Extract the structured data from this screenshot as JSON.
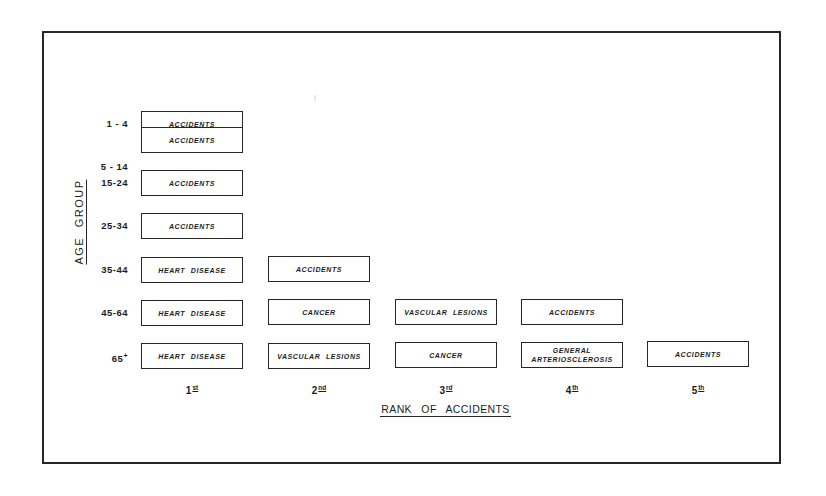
{
  "diagram": {
    "y_axis_title": "AGE GROUP",
    "x_axis_title": "RANK OF ACCIDENTS",
    "ranks": [
      {
        "num": "1",
        "suffix": "st"
      },
      {
        "num": "2",
        "suffix": "nd"
      },
      {
        "num": "3",
        "suffix": "rd"
      },
      {
        "num": "4",
        "suffix": "th"
      },
      {
        "num": "5",
        "suffix": "th"
      }
    ],
    "age_groups": [
      {
        "label": "1 - 4",
        "sup": "",
        "causes": [
          "ACCIDENTS"
        ]
      },
      {
        "label": "5 - 14",
        "sup": "",
        "causes": [
          "ACCIDENTS"
        ]
      },
      {
        "label": "15-24",
        "sup": "",
        "causes": [
          "ACCIDENTS"
        ]
      },
      {
        "label": "25-34",
        "sup": "",
        "causes": [
          "ACCIDENTS"
        ]
      },
      {
        "label": "35-44",
        "sup": "",
        "causes": [
          "HEART DISEASE",
          "ACCIDENTS"
        ]
      },
      {
        "label": "45-64",
        "sup": "",
        "causes": [
          "HEART DISEASE",
          "CANCER",
          "VASCULAR LESIONS",
          "ACCIDENTS"
        ]
      },
      {
        "label": "65",
        "sup": "+",
        "causes": [
          "HEART DISEASE",
          "VASCULAR LESIONS",
          "CANCER",
          "GENERAL ARTERIOSCLEROSIS",
          "ACCIDENTS"
        ]
      }
    ]
  },
  "colors": {
    "line": "#262626",
    "text": "#1c1c1c",
    "background": "#ffffff"
  }
}
